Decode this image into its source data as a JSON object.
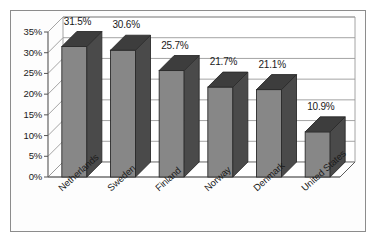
{
  "chart_data": {
    "type": "bar",
    "title": "",
    "subtitle": "",
    "xlabel": "",
    "ylabel": "",
    "categories": [
      "Netherlands",
      "Sweden",
      "Finland",
      "Norway",
      "Denmark",
      "United States"
    ],
    "values": [
      31.5,
      30.6,
      25.7,
      21.7,
      21.1,
      10.9
    ],
    "value_labels": [
      "31.5%",
      "30.6%",
      "25.7%",
      "21.7%",
      "21.1%",
      "10.9%"
    ],
    "series": [
      {
        "name": "",
        "values": [
          31.5,
          30.6,
          25.7,
          21.7,
          21.1,
          10.9
        ]
      }
    ],
    "ylim": [
      0,
      35
    ],
    "ytick_values": [
      0,
      5,
      10,
      15,
      20,
      25,
      30,
      35
    ],
    "ytick_labels": [
      "0%",
      "5%",
      "10%",
      "15%",
      "20%",
      "25%",
      "30%",
      "35%"
    ],
    "grid": true,
    "grid_axis": "y",
    "legend": false,
    "legend_position": "none",
    "style": "3d-column",
    "annotations": []
  },
  "colors": {
    "bar_front": "#878787",
    "bar_side": "#4a4a4a",
    "bar_top": "#3d3d3d",
    "bar_outline": "#2b2b2b",
    "gridline": "#9a9a9a",
    "axis_line": "#555555",
    "frame_border": "#8c8c8c",
    "wall_background": "#ffffff",
    "floor_background": "#ffffff",
    "text": "#1a1a1a",
    "page_background": "#ffffff"
  },
  "axis": {
    "y_axis_name": "percent-axis",
    "x_axis_name": "country-axis"
  }
}
